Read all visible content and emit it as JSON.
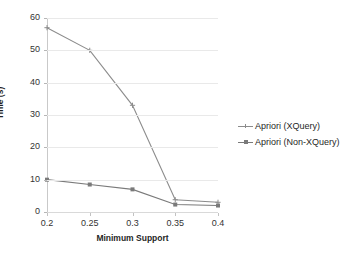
{
  "chart_data": {
    "type": "line",
    "title": "",
    "xlabel": "Minimum Support",
    "ylabel": "Time (s)",
    "categories": [
      "0.2",
      "0.25",
      "0.3",
      "0.35",
      "0.4"
    ],
    "x": [
      0.2,
      0.25,
      0.3,
      0.35,
      0.4
    ],
    "series": [
      {
        "name": "Apriori (XQuery)",
        "values": [
          57,
          50,
          33,
          3.8,
          3
        ],
        "color": "#8c8c8c",
        "marker": "plus"
      },
      {
        "name": "Apriori (Non-XQuery)",
        "values": [
          10,
          8.5,
          7,
          2.3,
          2
        ],
        "color": "#7a7a7a",
        "marker": "square"
      }
    ],
    "ylim": [
      0,
      60
    ],
    "yticks": [
      0,
      10,
      20,
      30,
      40,
      50,
      60
    ],
    "ytick_labels": [
      "0",
      "10",
      "20",
      "30",
      "40",
      "50",
      "60"
    ],
    "grid": "horizontal",
    "legend_position": "right"
  },
  "axes": {
    "y_title": "Time (s)",
    "x_title": "Minimum Support"
  },
  "legend": {
    "entries": [
      {
        "label": "Apriori (XQuery)"
      },
      {
        "label": "Apriori (Non-XQuery)"
      }
    ]
  },
  "colors": {
    "series_1": "#8c8c8c",
    "series_2": "#7a7a7a",
    "grid": "#e9e9e9",
    "axis": "#c9c9c9",
    "text": "#1f1f1f",
    "background": "#ffffff"
  }
}
